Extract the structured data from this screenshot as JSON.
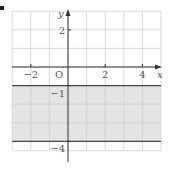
{
  "chart_data": {
    "type": "area",
    "title": "",
    "xlabel": "x",
    "ylabel": "y",
    "origin_label": "O",
    "xlim": [
      -3,
      5
    ],
    "ylim": [
      -4.5,
      3
    ],
    "grid": true,
    "grid_step": 1,
    "x_ticks": [
      -2,
      2,
      4
    ],
    "x_tick_labels": [
      "−2",
      "2",
      "4"
    ],
    "y_ticks": [
      2,
      -1,
      -4
    ],
    "y_tick_labels": [
      "2",
      "−1",
      "−4"
    ],
    "boundary_lines": [
      {
        "name": "y = -1",
        "y": -1,
        "style": "solid"
      },
      {
        "name": "y = -4",
        "y": -4,
        "style": "solid"
      }
    ],
    "shaded_region": {
      "description": "-4 ≤ y ≤ -1",
      "y_from": -4,
      "y_to": -1,
      "color": "#e4e4e4"
    },
    "colors": {
      "grid": "#d0d0d0",
      "axis": "#333333",
      "boundary": "#444444",
      "shade": "#e4e4e4",
      "label": "#555555"
    }
  }
}
